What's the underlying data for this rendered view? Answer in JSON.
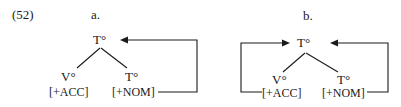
{
  "example_number": "(52)",
  "diagrams": [
    {
      "label": "a.",
      "root": "T°",
      "left_child": {
        "head": "V°",
        "feature": "[+ACC]"
      },
      "right_child": {
        "head": "T°",
        "feature": "[+NOM]"
      },
      "arrows": [
        "[+NOM] → root T°"
      ]
    },
    {
      "label": "b.",
      "root": "T°",
      "left_child": {
        "head": "V°",
        "feature": "[+ACC]"
      },
      "right_child": {
        "head": "T°",
        "feature": "[+NOM]"
      },
      "arrows": [
        "[+ACC] → root T°",
        "[+NOM] → root T°"
      ]
    }
  ],
  "colors": {
    "ink": "#1a1a1a",
    "background": "#ffffff"
  }
}
